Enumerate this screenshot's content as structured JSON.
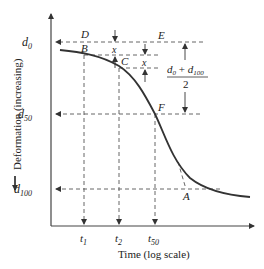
{
  "figure": {
    "type": "consolidation-curve-log-time",
    "y_axis_label": "Deformation (increasing)",
    "x_axis_label": "Time (log scale)",
    "y_ticks": [
      {
        "base": "d",
        "sub": "0"
      },
      {
        "base": "d",
        "sub": "50"
      },
      {
        "base": "d",
        "sub": "100"
      }
    ],
    "x_ticks": [
      {
        "base": "t",
        "sub": "1"
      },
      {
        "base": "t",
        "sub": "2"
      },
      {
        "base": "t",
        "sub": "50"
      }
    ],
    "points": {
      "A": "A",
      "B": "B",
      "C": "C",
      "D": "D",
      "E": "E",
      "F": "F"
    },
    "offset_label": "x",
    "midpoint_formula": {
      "numerator_a": "d",
      "numerator_a_sub": "0",
      "plus": "+",
      "numerator_b": "d",
      "numerator_b_sub": "100",
      "denominator": "2"
    },
    "colors": {
      "curve": "#333333",
      "axis": "#444444",
      "dashed": "#555555"
    }
  }
}
